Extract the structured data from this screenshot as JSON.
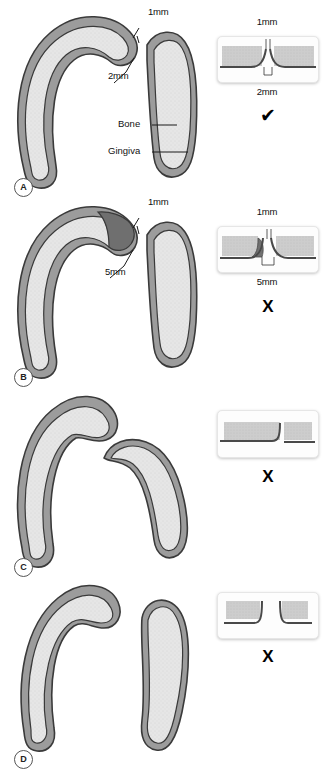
{
  "figure": {
    "colors": {
      "bone_fill": "#e4e4e4",
      "gingiva_band": "#9c9c9c",
      "outline": "#3a3a3a",
      "defect_shade": "#6f6f6f",
      "inset_bg": "#fdfdfd",
      "text": "#111111"
    }
  },
  "panels": [
    {
      "id": "A",
      "badge": "A",
      "labels": {
        "contact_gap": "1mm",
        "bone_to_contact": "2mm",
        "bone": "Bone",
        "gingiva": "Gingiva"
      },
      "inset": {
        "top_label": "1mm",
        "bottom_label": "2mm",
        "verdict": "✔",
        "verdict_name": "check"
      }
    },
    {
      "id": "B",
      "badge": "B",
      "labels": {
        "contact_gap": "1mm",
        "bone_to_contact": "5mm"
      },
      "inset": {
        "top_label": "1mm",
        "bottom_label": "5mm",
        "verdict": "X",
        "verdict_name": "cross"
      }
    },
    {
      "id": "C",
      "badge": "C",
      "labels": {},
      "inset": {
        "top_label": "",
        "bottom_label": "",
        "verdict": "X",
        "verdict_name": "cross"
      }
    },
    {
      "id": "D",
      "badge": "D",
      "labels": {},
      "inset": {
        "top_label": "",
        "bottom_label": "",
        "verdict": "X",
        "verdict_name": "cross"
      }
    }
  ]
}
